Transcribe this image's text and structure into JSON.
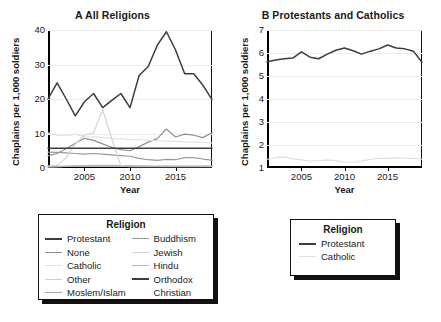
{
  "figure": {
    "ylabel": "Chaplains per 1,000 soldiers",
    "xlabel": "Year"
  },
  "panel_a": {
    "title": "A  All Religions",
    "yticks": [
      "0",
      "10",
      "20",
      "30",
      "40"
    ],
    "xticks": [
      "2005",
      "2010",
      "2015"
    ]
  },
  "panel_b": {
    "title": "B  Protestants and Catholics",
    "yticks": [
      "1",
      "2",
      "3",
      "4",
      "5",
      "6",
      "7"
    ],
    "xticks": [
      "2005",
      "2010",
      "2015"
    ]
  },
  "legend_a": {
    "title": "Religion",
    "col1": [
      {
        "label": "Protestant",
        "color": "#3d3d3d",
        "width": 2.2
      },
      {
        "label": "None",
        "color": "#909090",
        "width": 1.6
      },
      {
        "label": "Catholic",
        "color": "#e2e2e2",
        "width": 1.6
      },
      {
        "label": "Other",
        "color": "#cfcfcf",
        "width": 1.6
      },
      {
        "label": "Moslem/Islam",
        "color": "#a8a8a8",
        "width": 1.6
      }
    ],
    "col2": [
      {
        "label": "Buddhism",
        "color": "#9a9a9a",
        "width": 1.6
      },
      {
        "label": "Jewish",
        "color": "#d4d4d4",
        "width": 1.6
      },
      {
        "label": "Hindu",
        "color": "#b5b5b5",
        "width": 1.6
      },
      {
        "label": "Orthodox",
        "color": "#3d3d3d",
        "width": 2.2
      },
      {
        "label": "Christian",
        "color": "#ffffff",
        "width": 0
      }
    ]
  },
  "legend_b": {
    "title": "Religion",
    "items": [
      {
        "label": "Protestant",
        "color": "#3d3d3d",
        "width": 2.2
      },
      {
        "label": "Catholic",
        "color": "#e0e0e0",
        "width": 1.8
      }
    ]
  },
  "chart_data": [
    {
      "type": "line",
      "panel": "A",
      "title": "A  All Religions",
      "xlabel": "Year",
      "ylabel": "Chaplains per 1,000 soldiers",
      "xlim": [
        2001,
        2019
      ],
      "ylim": [
        0,
        40
      ],
      "yticks": [
        0,
        10,
        20,
        30,
        40
      ],
      "xticks": [
        2005,
        2010,
        2015
      ],
      "grid": "horizontal",
      "legend_position": "below-left",
      "x": [
        2001,
        2002,
        2003,
        2004,
        2005,
        2006,
        2007,
        2008,
        2009,
        2010,
        2011,
        2012,
        2013,
        2014,
        2015,
        2016,
        2017,
        2018,
        2019
      ],
      "series": [
        {
          "name": "Protestant",
          "color": "#3d3d3d",
          "values": [
            20.0,
            24.7,
            20.0,
            15.1,
            19.2,
            21.6,
            17.5,
            19.6,
            21.6,
            17.5,
            26.8,
            29.4,
            35.6,
            39.5,
            34.2,
            27.3,
            27.3,
            24.0,
            19.8
          ]
        },
        {
          "name": "None",
          "color": "#909090",
          "values": [
            3.5,
            4.2,
            5.6,
            7.2,
            8.6,
            8.0,
            7.0,
            6.0,
            5.3,
            5.0,
            6.2,
            7.5,
            8.5,
            11.3,
            9.0,
            9.8,
            9.5,
            8.8,
            10.2
          ]
        },
        {
          "name": "Catholic",
          "color": "#e2e2e2",
          "values": [
            10.2,
            9.5,
            9.4,
            9.8,
            9.1,
            9.0,
            8.8,
            8.6,
            8.5,
            8.3,
            8.2,
            8.0,
            7.9,
            7.8,
            7.7,
            7.6,
            7.5,
            7.4,
            7.3
          ]
        },
        {
          "name": "Other",
          "color": "#cfcfcf",
          "values": [
            0.3,
            0.4,
            0.5,
            0.6,
            0.7,
            0.8,
            0.8,
            0.8,
            0.7,
            0.6,
            0.6,
            0.5,
            0.5,
            0.5,
            0.5,
            0.5,
            0.5,
            0.5,
            0.5
          ]
        },
        {
          "name": "Moslem/Islam",
          "color": "#a8a8a8",
          "values": [
            0.3,
            0.4,
            0.5,
            0.6,
            0.6,
            0.6,
            0.6,
            0.6,
            0.6,
            0.6,
            0.5,
            0.5,
            0.5,
            0.5,
            0.5,
            0.5,
            0.5,
            0.5,
            0.5
          ]
        },
        {
          "name": "Buddhism",
          "color": "#9a9a9a",
          "values": [
            4.6,
            4.5,
            4.4,
            4.2,
            4.0,
            4.2,
            4.0,
            3.8,
            3.6,
            3.4,
            2.8,
            2.4,
            2.2,
            2.5,
            2.4,
            3.0,
            3.0,
            2.6,
            2.3
          ]
        },
        {
          "name": "Jewish",
          "color": "#d4d4d4",
          "values": [
            0.6,
            0.7,
            3.0,
            7.0,
            9.5,
            10.2,
            16.8,
            8.4,
            0.6,
            0.4,
            0.4,
            0.4,
            0.4,
            0.4,
            0.4,
            0.4,
            0.4,
            0.4,
            0.4
          ]
        },
        {
          "name": "Hindu",
          "color": "#b5b5b5",
          "values": [
            0.5,
            0.5,
            0.5,
            0.5,
            0.5,
            0.5,
            0.5,
            0.5,
            0.5,
            0.5,
            0.5,
            0.5,
            0.5,
            0.5,
            0.5,
            0.5,
            0.5,
            0.5,
            0.5
          ]
        },
        {
          "name": "Orthodox Christian",
          "color": "#3d3d3d",
          "values": [
            5.7,
            5.7,
            5.7,
            5.7,
            5.7,
            5.7,
            5.7,
            5.7,
            5.7,
            5.7,
            5.7,
            5.7,
            5.7,
            5.7,
            5.7,
            5.7,
            5.7,
            5.7,
            5.7
          ]
        }
      ]
    },
    {
      "type": "line",
      "panel": "B",
      "title": "B  Protestants and Catholics",
      "xlabel": "Year",
      "ylabel": "Chaplains per 1,000 soldiers",
      "xlim": [
        2001,
        2019
      ],
      "ylim": [
        1,
        7
      ],
      "yticks": [
        1,
        2,
        3,
        4,
        5,
        6,
        7
      ],
      "xticks": [
        2005,
        2010,
        2015
      ],
      "grid": "horizontal",
      "legend_position": "below-right",
      "x": [
        2001,
        2002,
        2003,
        2004,
        2005,
        2006,
        2007,
        2008,
        2009,
        2010,
        2011,
        2012,
        2013,
        2014,
        2015,
        2016,
        2017,
        2018,
        2019
      ],
      "series": [
        {
          "name": "Protestant",
          "color": "#3d3d3d",
          "values": [
            5.62,
            5.7,
            5.75,
            5.78,
            6.05,
            5.82,
            5.75,
            5.95,
            6.12,
            6.22,
            6.1,
            5.95,
            6.08,
            6.18,
            6.35,
            6.22,
            6.18,
            6.08,
            5.6
          ]
        },
        {
          "name": "Catholic",
          "color": "#e0e0e0",
          "values": [
            1.38,
            1.45,
            1.48,
            1.4,
            1.35,
            1.3,
            1.32,
            1.35,
            1.32,
            1.25,
            1.25,
            1.3,
            1.38,
            1.42,
            1.42,
            1.45,
            1.43,
            1.42,
            1.38
          ]
        }
      ]
    }
  ]
}
